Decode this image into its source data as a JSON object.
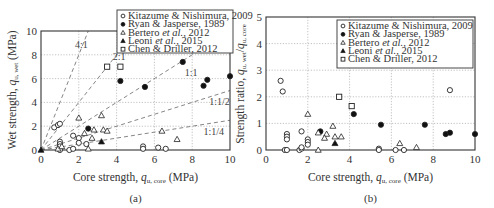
{
  "chart_data": [
    {
      "id": "a",
      "type": "scatter",
      "caption": "(a)",
      "xlabel": "Core strength, q_u, core (MPa)",
      "xlabel_main": "Core strength, ",
      "xlabel_q": "q",
      "xlabel_sub": "u, core",
      "xlabel_unit": " (MPa)",
      "ylabel_main": "Wet strength, ",
      "ylabel_q": "q",
      "ylabel_sub": "u, wet",
      "ylabel_unit": " (MPa)",
      "xlim": [
        0,
        10
      ],
      "ylim": [
        0,
        10
      ],
      "xticks": [
        "0",
        "2",
        "4",
        "6",
        "8",
        "10"
      ],
      "yticks": [
        "0",
        "2",
        "4",
        "6",
        "8",
        "10"
      ],
      "grid": true,
      "legend_position": "upper-right",
      "reference_lines": [
        {
          "label": "4:1",
          "slope": 4
        },
        {
          "label": "2:1",
          "slope": 2
        },
        {
          "label": "1:1",
          "slope": 1
        },
        {
          "label": "1:1/2",
          "slope": 0.5
        },
        {
          "label": "1:1/4",
          "slope": 0.25
        }
      ],
      "series": [
        {
          "name": "Kitazume & Nishimura, 2009",
          "marker": "open-circle",
          "points": [
            [
              0.7,
              1.9
            ],
            [
              0.9,
              2.1
            ],
            [
              1.0,
              2.2
            ],
            [
              1.0,
              0.7
            ],
            [
              1.0,
              0.5
            ],
            [
              1.0,
              0.3
            ],
            [
              1.7,
              1.2
            ],
            [
              2.0,
              1.0
            ],
            [
              2.0,
              0.6
            ],
            [
              2.4,
              0.5
            ],
            [
              1.0,
              0.0
            ],
            [
              1.5,
              0.0
            ],
            [
              1.7,
              0.1
            ],
            [
              5.4,
              0.3
            ],
            [
              5.4,
              0.1
            ],
            [
              6.2,
              0.2
            ],
            [
              6.6,
              0.1
            ]
          ]
        },
        {
          "name": "Ryan & Jasperse, 1989",
          "marker": "filled-circle",
          "points": [
            [
              2.5,
              1.8
            ],
            [
              4.2,
              5.8
            ],
            [
              5.5,
              5.3
            ],
            [
              7.5,
              7.4
            ],
            [
              8.6,
              5.4
            ],
            [
              8.8,
              5.9
            ],
            [
              10.0,
              6.2
            ]
          ]
        },
        {
          "name": "Bertero et al., 2012",
          "marker": "open-triangle",
          "points": [
            [
              2.0,
              2.7
            ],
            [
              3.2,
              2.9
            ],
            [
              2.8,
              1.7
            ],
            [
              3.3,
              1.7
            ],
            [
              3.5,
              1.6
            ],
            [
              2.7,
              1.0
            ],
            [
              6.4,
              1.6
            ],
            [
              7.2,
              0.9
            ],
            [
              0.9,
              0.1
            ],
            [
              2.5,
              0.1
            ],
            [
              1.1,
              0.3
            ],
            [
              2.3,
              1.4
            ]
          ]
        },
        {
          "name": "Leoni et al., 2015",
          "marker": "filled-triangle",
          "points": [
            [
              3.2,
              0.7
            ],
            [
              0.0,
              0.0
            ]
          ]
        },
        {
          "name": "Chen & Driller, 2012",
          "marker": "open-square",
          "points": [
            [
              3.5,
              7.0
            ],
            [
              4.2,
              7.0
            ]
          ]
        }
      ]
    },
    {
      "id": "b",
      "type": "scatter",
      "caption": "(b)",
      "xlabel": "Core strength, q_u, core (MPa)",
      "xlabel_main": "Core strength, ",
      "xlabel_q": "q",
      "xlabel_sub": "u, core",
      "xlabel_unit": " (MPa)",
      "ylabel": "Strength ratio, q_u, wet / q_u, core",
      "ylabel_main": "Strength ratio, ",
      "ylabel_q1": "q",
      "ylabel_sub1": "u, wet",
      "ylabel_slash": "/",
      "ylabel_q2": "q",
      "ylabel_sub2": "u, core",
      "xlim": [
        0,
        10
      ],
      "ylim": [
        0,
        5
      ],
      "xticks": [
        "0",
        "2",
        "4",
        "6",
        "8",
        "10"
      ],
      "yticks": [
        "0",
        "1",
        "2",
        "3",
        "4",
        "5"
      ],
      "grid": true,
      "legend_position": "upper-right",
      "series": [
        {
          "name": "Kitazume & Nishimura, 2009",
          "marker": "open-circle",
          "points": [
            [
              0.7,
              2.6
            ],
            [
              0.8,
              2.2
            ],
            [
              1.0,
              0.6
            ],
            [
              1.0,
              0.5
            ],
            [
              1.0,
              0.4
            ],
            [
              1.7,
              0.7
            ],
            [
              2.0,
              0.4
            ],
            [
              2.0,
              0.3
            ],
            [
              2.0,
              0.2
            ],
            [
              0.9,
              0.0
            ],
            [
              1.0,
              0.0
            ],
            [
              1.6,
              0.0
            ],
            [
              1.7,
              0.05
            ],
            [
              1.7,
              0.1
            ],
            [
              5.4,
              0.05
            ],
            [
              5.4,
              0.0
            ],
            [
              6.2,
              0.0
            ],
            [
              6.6,
              0.0
            ],
            [
              8.8,
              2.25
            ]
          ]
        },
        {
          "name": "Ryan & Jasperse, 1989",
          "marker": "filled-circle",
          "points": [
            [
              2.6,
              0.7
            ],
            [
              4.2,
              1.35
            ],
            [
              5.5,
              0.95
            ],
            [
              7.6,
              0.95
            ],
            [
              8.6,
              0.6
            ],
            [
              8.8,
              0.65
            ],
            [
              10.0,
              0.6
            ]
          ]
        },
        {
          "name": "Bertero et al., 2012",
          "marker": "open-triangle",
          "points": [
            [
              2.0,
              1.35
            ],
            [
              3.2,
              0.9
            ],
            [
              2.5,
              0.65
            ],
            [
              2.9,
              0.6
            ],
            [
              2.8,
              0.45
            ],
            [
              3.3,
              0.5
            ],
            [
              3.6,
              0.5
            ],
            [
              2.5,
              0.0
            ],
            [
              6.4,
              0.25
            ],
            [
              7.2,
              0.1
            ]
          ]
        },
        {
          "name": "Leoni et al., 2015",
          "marker": "filled-triangle",
          "points": [
            [
              3.3,
              0.25
            ]
          ]
        },
        {
          "name": "Chen & Driller, 2012",
          "marker": "open-square",
          "points": [
            [
              3.5,
              2.0
            ],
            [
              4.1,
              1.65
            ]
          ]
        }
      ]
    }
  ],
  "legend": [
    {
      "pre": "Kitazume & Nishimura, 2009",
      "ital": "",
      "post": "",
      "marker": "open-circle"
    },
    {
      "pre": "Ryan & Jasperse, 1989",
      "ital": "",
      "post": "",
      "marker": "filled-circle"
    },
    {
      "pre": "Bertero ",
      "ital": "et al.",
      "post": ", 2012",
      "marker": "open-triangle"
    },
    {
      "pre": "Leoni ",
      "ital": "et al.",
      "post": ", 2015",
      "marker": "filled-triangle"
    },
    {
      "pre": "Chen & Driller, 2012",
      "ital": "",
      "post": "",
      "marker": "open-square"
    }
  ]
}
